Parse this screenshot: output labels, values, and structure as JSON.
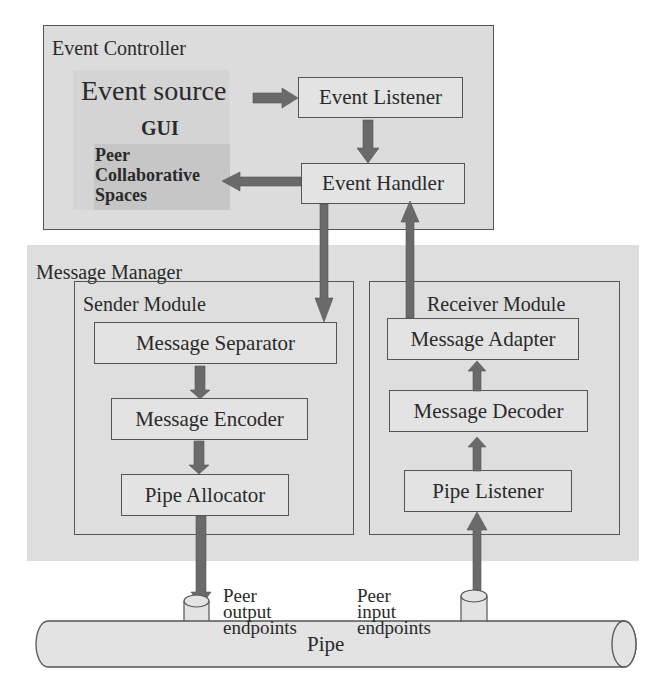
{
  "diagram": {
    "event_controller": {
      "title": "Event Controller",
      "event_source": "Event source",
      "gui": "GUI",
      "peer_spaces": [
        "Peer",
        "Collaborative",
        "Spaces"
      ],
      "event_listener": "Event Listener",
      "event_handler": "Event Handler"
    },
    "message_manager": {
      "title": "Message Manager",
      "sender": {
        "title": "Sender Module",
        "separator": "Message Separator",
        "encoder": "Message Encoder",
        "allocator": "Pipe Allocator"
      },
      "receiver": {
        "title": "Receiver Module",
        "adapter": "Message Adapter",
        "decoder": "Message Decoder",
        "listener": "Pipe Listener"
      }
    },
    "endpoints": {
      "output": [
        "Peer",
        "output",
        "endpoints"
      ],
      "input": [
        "Peer",
        "input",
        "endpoints"
      ]
    },
    "pipe": "Pipe",
    "colors": {
      "panel_bg": "#dcdcdc",
      "box_bg": "#e3e3e3",
      "border": "#555555",
      "arrow": "#6a6a6a",
      "gui_bg": "#c8c8c8"
    }
  }
}
